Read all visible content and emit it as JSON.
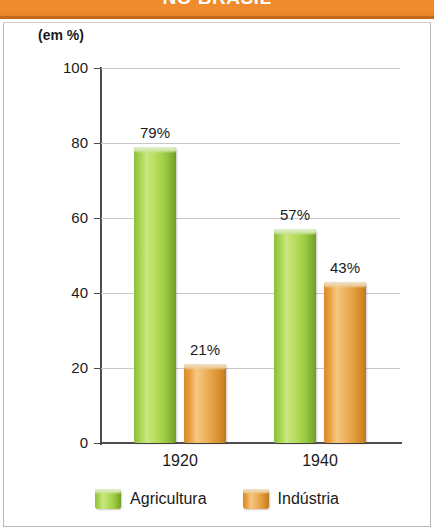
{
  "title": {
    "text": "NO BRASIL",
    "band_color": "#ef8c30",
    "text_color": "#ffffff"
  },
  "unit_label": "(em %)",
  "legend": {
    "position": "bottom-center",
    "items": [
      {
        "label": "Agricultura",
        "color": "#a7d34e",
        "swatch_icon": "cylinder-swatch-green"
      },
      {
        "label": "Indústria",
        "color": "#e89f3f",
        "swatch_icon": "cylinder-swatch-orange"
      }
    ]
  },
  "axis": {
    "y_ticks": [
      "0",
      "20",
      "40",
      "60",
      "80",
      "100"
    ],
    "x_categories": [
      "1920",
      "1940"
    ]
  },
  "bars": [
    {
      "category": "1920",
      "series": "Agricultura",
      "value": 79,
      "label": "79%",
      "color": "#a7d34e"
    },
    {
      "category": "1920",
      "series": "Indústria",
      "value": 21,
      "label": "21%",
      "color": "#e89f3f"
    },
    {
      "category": "1940",
      "series": "Agricultura",
      "value": 57,
      "label": "57%",
      "color": "#a7d34e"
    },
    {
      "category": "1940",
      "series": "Indústria",
      "value": 43,
      "label": "43%",
      "color": "#e89f3f"
    }
  ],
  "chart_data": {
    "type": "bar",
    "title": "NO BRASIL",
    "subtitle": "",
    "categories": [
      "1920",
      "1940"
    ],
    "series": [
      {
        "name": "Agricultura",
        "values": [
          79,
          57
        ],
        "color": "#a7d34e"
      },
      {
        "name": "Indústria",
        "values": [
          21,
          43
        ],
        "color": "#e89f3f"
      }
    ],
    "data_labels": [
      [
        "79%",
        "57%"
      ],
      [
        "21%",
        "43%"
      ]
    ],
    "xlabel": "",
    "ylabel": "(em %)",
    "ylim": [
      0,
      100
    ],
    "ytick_values": [
      0,
      20,
      40,
      60,
      80,
      100
    ],
    "grid": "horizontal",
    "legend_position": "bottom-center",
    "units": "percent"
  }
}
